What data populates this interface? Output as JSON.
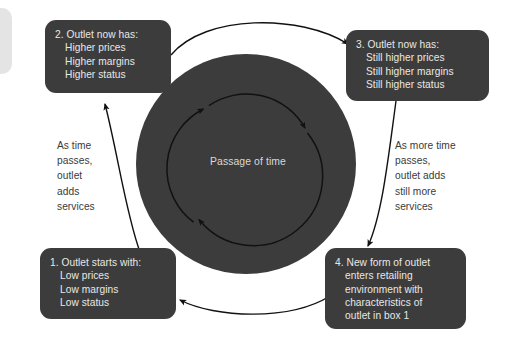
{
  "diagram": {
    "center": {
      "label": "Passage of time"
    },
    "boxes": [
      {
        "id": "box1",
        "lines": [
          "1. Outlet starts with:",
          "Low prices",
          "Low margins",
          "Low status"
        ]
      },
      {
        "id": "box2",
        "lines": [
          "2. Outlet now has:",
          "Higher prices",
          "Higher margins",
          "Higher status"
        ]
      },
      {
        "id": "box3",
        "lines": [
          "3. Outlet now has:",
          "Still higher prices",
          "Still higher margins",
          "Still higher status"
        ]
      },
      {
        "id": "box4",
        "lines": [
          "4. New form of outlet",
          "enters retailing",
          "environment with",
          "characteristics of",
          "outlet in box 1"
        ]
      }
    ],
    "captions": {
      "left": [
        "As time",
        "passes,",
        "outlet",
        "adds",
        "services"
      ],
      "right": [
        "As more time",
        "passes,",
        "outlet adds",
        "still more",
        "services"
      ]
    },
    "colors": {
      "box_fill": "#3c3c3c",
      "box_text": "#e8e8e6",
      "disc_fill": "#3c3c3c",
      "caption_text": "#3a3a3a",
      "arrow_stroke": "#111111",
      "background": "#ffffff"
    }
  }
}
